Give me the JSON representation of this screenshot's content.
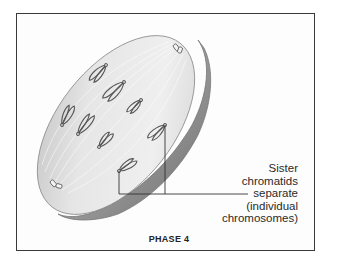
{
  "figure": {
    "title": "PHASE 4",
    "annotation": {
      "lines": [
        "Sister",
        "chromatids",
        "separate",
        "(individual",
        "chromosomes)"
      ]
    },
    "chromosome_count": 8,
    "colors": {
      "frame": "#3a3a3a",
      "cell_face": "#e4e4e4",
      "cell_edge": "#8c8c8c",
      "chromosome": "#555555"
    }
  }
}
